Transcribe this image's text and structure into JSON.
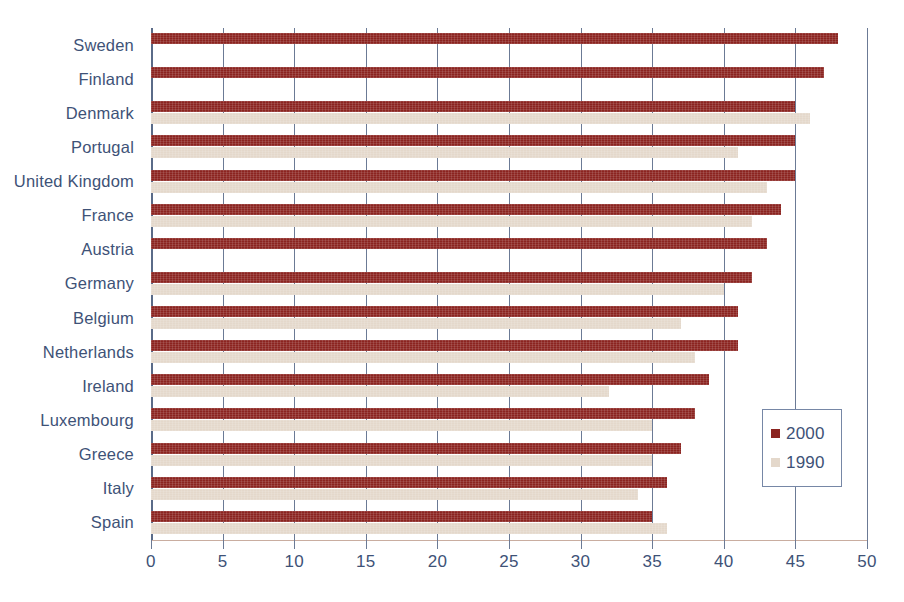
{
  "chart_data": {
    "type": "bar",
    "orientation": "horizontal",
    "title": "",
    "subtitle": "",
    "xlabel": "",
    "ylabel": "",
    "xlim": [
      0,
      50
    ],
    "xticks": [
      0,
      5,
      10,
      15,
      20,
      25,
      30,
      35,
      40,
      45,
      50
    ],
    "xtick_labels": [
      "0",
      "5",
      "10",
      "15",
      "20",
      "25",
      "30",
      "35",
      "40",
      "45",
      "50"
    ],
    "grid": true,
    "grid_axis": "x",
    "legend_position": "inside-right",
    "categories": [
      "Sweden",
      "Finland",
      "Denmark",
      "Portugal",
      "United Kingdom",
      "France",
      "Austria",
      "Germany",
      "Belgium",
      "Netherlands",
      "Ireland",
      "Luxembourg",
      "Greece",
      "Italy",
      "Spain"
    ],
    "series": [
      {
        "name": "2000",
        "color": "#8B2420",
        "values": [
          48,
          47,
          45,
          45,
          45,
          44,
          43,
          42,
          41,
          41,
          39,
          38,
          37,
          36,
          35
        ]
      },
      {
        "name": "1990",
        "color": "#E4D8CB",
        "values": [
          null,
          null,
          46,
          41,
          43,
          42,
          null,
          40,
          37,
          38,
          32,
          35,
          35,
          34,
          36
        ]
      }
    ],
    "legend": [
      {
        "label": "2000",
        "color": "#8B2420"
      },
      {
        "label": "1990",
        "color": "#E4D8CB"
      }
    ]
  },
  "style": {
    "text_color": "#3E5277",
    "grid_color": "#6b7a95",
    "axis_color": "#c9ada0",
    "background": "#ffffff"
  }
}
